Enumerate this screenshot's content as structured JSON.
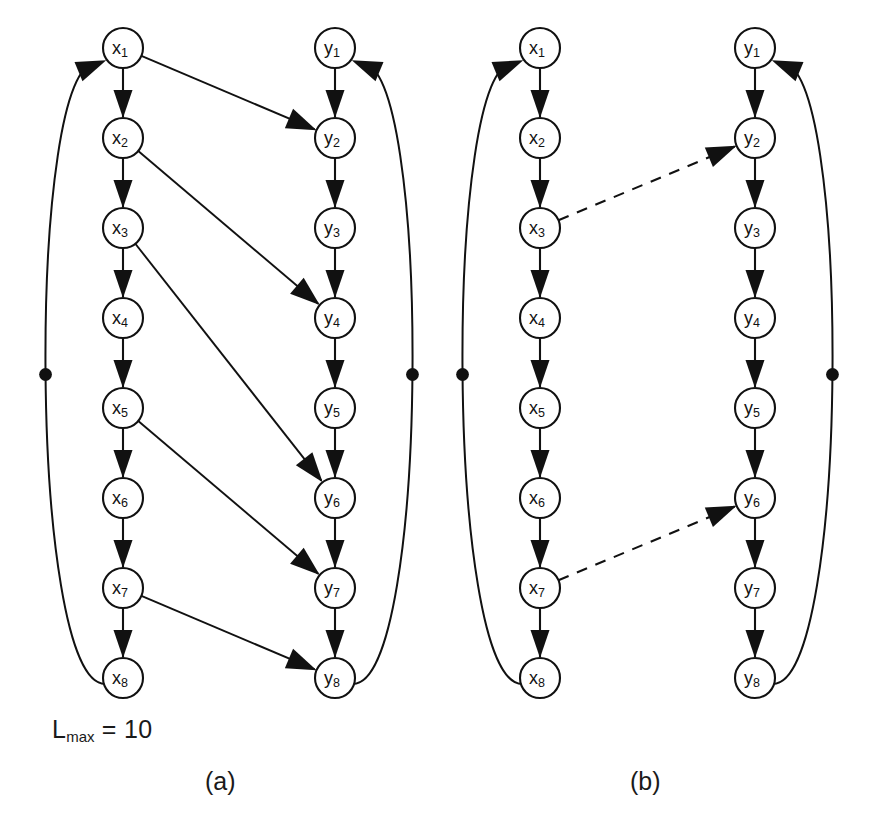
{
  "figure": {
    "lmax": {
      "prefix": "L",
      "subscript": "max",
      "equals": " = ",
      "value": "10",
      "full_text": "Lmax = 10"
    },
    "captions": {
      "a": "(a)",
      "b": "(b)"
    }
  },
  "colors": {
    "stroke": "#111111",
    "node_fill": "#ffffff",
    "background": "#ffffff",
    "text": "#1a1a1a"
  },
  "geometry": {
    "node_radius": 20,
    "row_start_y": 48,
    "row_spacing": 90,
    "panel_a": {
      "x_col_cx": 123,
      "y_col_cx": 335
    },
    "panel_b": {
      "x_col_cx": 540,
      "y_col_cx": 755
    }
  },
  "panels": [
    {
      "id": "a",
      "caption": "(a)",
      "x_nodes": [
        "x1",
        "x2",
        "x3",
        "x4",
        "x5",
        "x6",
        "x7",
        "x8"
      ],
      "y_nodes": [
        "y1",
        "y2",
        "y3",
        "y4",
        "y5",
        "y6",
        "y7",
        "y8"
      ],
      "x_node_labels": [
        {
          "base": "x",
          "sub": "1"
        },
        {
          "base": "x",
          "sub": "2"
        },
        {
          "base": "x",
          "sub": "3"
        },
        {
          "base": "x",
          "sub": "4"
        },
        {
          "base": "x",
          "sub": "5"
        },
        {
          "base": "x",
          "sub": "6"
        },
        {
          "base": "x",
          "sub": "7"
        },
        {
          "base": "x",
          "sub": "8"
        }
      ],
      "y_node_labels": [
        {
          "base": "y",
          "sub": "1"
        },
        {
          "base": "y",
          "sub": "2"
        },
        {
          "base": "y",
          "sub": "3"
        },
        {
          "base": "y",
          "sub": "4"
        },
        {
          "base": "y",
          "sub": "5"
        },
        {
          "base": "y",
          "sub": "6"
        },
        {
          "base": "y",
          "sub": "7"
        },
        {
          "base": "y",
          "sub": "8"
        }
      ],
      "chain_edges_x": [
        "x1->x2",
        "x2->x3",
        "x3->x4",
        "x4->x5",
        "x5->x6",
        "x6->x7",
        "x7->x8"
      ],
      "chain_edges_y": [
        "y1->y2",
        "y2->y3",
        "y3->y4",
        "y4->y5",
        "y5->y6",
        "y6->y7",
        "y7->y8"
      ],
      "cross_edges": [
        {
          "from": "x1",
          "to": "y2",
          "style": "solid"
        },
        {
          "from": "x2",
          "to": "y4",
          "style": "solid"
        },
        {
          "from": "x3",
          "to": "y6",
          "style": "solid"
        },
        {
          "from": "x5",
          "to": "y7",
          "style": "solid"
        },
        {
          "from": "x7",
          "to": "y8",
          "style": "solid"
        }
      ],
      "feedback_edges": [
        {
          "from": "x8",
          "to": "x1",
          "side": "left",
          "has_dot": true
        },
        {
          "from": "y8",
          "to": "y1",
          "side": "right",
          "has_dot": true
        }
      ]
    },
    {
      "id": "b",
      "caption": "(b)",
      "x_nodes": [
        "x1",
        "x2",
        "x3",
        "x4",
        "x5",
        "x6",
        "x7",
        "x8"
      ],
      "y_nodes": [
        "y1",
        "y2",
        "y3",
        "y4",
        "y5",
        "y6",
        "y7",
        "y8"
      ],
      "x_node_labels": [
        {
          "base": "x",
          "sub": "1"
        },
        {
          "base": "x",
          "sub": "2"
        },
        {
          "base": "x",
          "sub": "3"
        },
        {
          "base": "x",
          "sub": "4"
        },
        {
          "base": "x",
          "sub": "5"
        },
        {
          "base": "x",
          "sub": "6"
        },
        {
          "base": "x",
          "sub": "7"
        },
        {
          "base": "x",
          "sub": "8"
        }
      ],
      "y_node_labels": [
        {
          "base": "y",
          "sub": "1"
        },
        {
          "base": "y",
          "sub": "2"
        },
        {
          "base": "y",
          "sub": "3"
        },
        {
          "base": "y",
          "sub": "4"
        },
        {
          "base": "y",
          "sub": "5"
        },
        {
          "base": "y",
          "sub": "6"
        },
        {
          "base": "y",
          "sub": "7"
        },
        {
          "base": "y",
          "sub": "8"
        }
      ],
      "chain_edges_x": [
        "x1->x2",
        "x2->x3",
        "x3->x4",
        "x4->x5",
        "x5->x6",
        "x6->x7",
        "x7->x8"
      ],
      "chain_edges_y": [
        "y1->y2",
        "y2->y3",
        "y3->y4",
        "y4->y5",
        "y5->y6",
        "y6->y7",
        "y7->y8"
      ],
      "cross_edges": [
        {
          "from": "x3",
          "to": "y2",
          "style": "dashed"
        },
        {
          "from": "x7",
          "to": "y6",
          "style": "dashed"
        }
      ],
      "feedback_edges": [
        {
          "from": "x8",
          "to": "x1",
          "side": "left",
          "has_dot": true
        },
        {
          "from": "y8",
          "to": "y1",
          "side": "right",
          "has_dot": true
        }
      ]
    }
  ]
}
